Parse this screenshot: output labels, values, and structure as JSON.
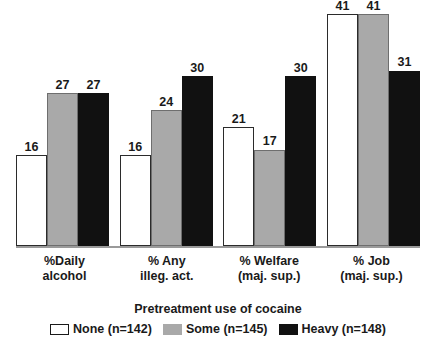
{
  "chart_data": {
    "type": "bar",
    "title": "",
    "xlabel": "",
    "ylabel": "",
    "ylim": [
      0,
      41
    ],
    "grid": false,
    "legend_position": "bottom",
    "legend_title": "Pretreatment use of cocaine",
    "categories": [
      "%Daily alcohol",
      "% Any illeg. act.",
      "% Welfare (maj. sup.)",
      "% Job (maj. sup.)"
    ],
    "category_lines": [
      {
        "line1": "%Daily",
        "line2": "alcohol"
      },
      {
        "line1": "% Any",
        "line2": "illeg. act."
      },
      {
        "line1": "% Welfare",
        "line2": "(maj. sup.)"
      },
      {
        "line1": "% Job",
        "line2": "(maj. sup.)"
      }
    ],
    "series": [
      {
        "name": "None (n=142)",
        "key": "none",
        "color": "#ffffff",
        "values": [
          16,
          16,
          21,
          41
        ]
      },
      {
        "name": "Some (n=145)",
        "key": "some",
        "color": "#a9a9a9",
        "values": [
          27,
          24,
          17,
          41
        ]
      },
      {
        "name": "Heavy (n=148)",
        "key": "heavy",
        "color": "#111111",
        "values": [
          27,
          30,
          30,
          31
        ]
      }
    ]
  },
  "groups": [
    {
      "label_line1": "%Daily",
      "label_line2": "alcohol",
      "bars": [
        {
          "series": "none",
          "value": "16"
        },
        {
          "series": "some",
          "value": "27"
        },
        {
          "series": "heavy",
          "value": "27"
        }
      ]
    },
    {
      "label_line1": "% Any",
      "label_line2": "illeg. act.",
      "bars": [
        {
          "series": "none",
          "value": "16"
        },
        {
          "series": "some",
          "value": "24"
        },
        {
          "series": "heavy",
          "value": "30"
        }
      ]
    },
    {
      "label_line1": "% Welfare",
      "label_line2": "(maj. sup.)",
      "bars": [
        {
          "series": "none",
          "value": "21"
        },
        {
          "series": "some",
          "value": "17"
        },
        {
          "series": "heavy",
          "value": "30"
        }
      ]
    },
    {
      "label_line1": "% Job",
      "label_line2": "(maj. sup.)",
      "bars": [
        {
          "series": "none",
          "value": "41"
        },
        {
          "series": "some",
          "value": "41"
        },
        {
          "series": "heavy",
          "value": "31"
        }
      ]
    }
  ],
  "legend": {
    "title": "Pretreatment use of cocaine",
    "items": [
      {
        "key": "none",
        "label": "None (n=142)"
      },
      {
        "key": "some",
        "label": "Some (n=145)"
      },
      {
        "key": "heavy",
        "label": "Heavy (n=148)"
      }
    ]
  },
  "colors": {
    "none": "#ffffff",
    "some": "#a9a9a9",
    "heavy": "#111111",
    "axis": "#9a9a9a",
    "text": "#1a1a1a"
  }
}
